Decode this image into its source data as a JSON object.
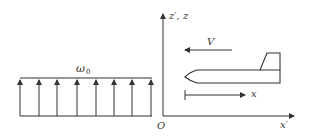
{
  "figure": {
    "left_panel": {
      "label_symbol": "ω",
      "label_subscript": "0",
      "arrow_count": 8,
      "arrow_x": [
        20,
        39,
        57,
        77,
        96,
        114,
        132,
        151
      ]
    },
    "right_panel": {
      "vertical_axis_label": "z′, z",
      "horizontal_axis_label": "x′",
      "origin_label": "O",
      "velocity_label": "V",
      "body_axis_label": "x"
    },
    "colors": {
      "stroke": "#333333",
      "background": "#ffffff"
    }
  }
}
